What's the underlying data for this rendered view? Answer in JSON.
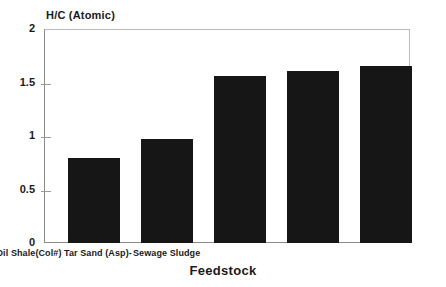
{
  "chart_data": {
    "type": "bar",
    "title": "",
    "subtitle": "",
    "xlabel": "Feedstock",
    "ylabel": "H/C (Atomic)",
    "categories": [
      "Bit Coal (Pitt#8)",
      "Sub-bit (Wy)",
      "Oil Shale(Col#)",
      "Tar Sand (Asp)-",
      "Sewage Sludge"
    ],
    "values": [
      0.79,
      0.97,
      1.56,
      1.61,
      1.65
    ],
    "ylim": [
      0,
      2
    ],
    "yticks": [
      "0",
      "0.5",
      "1",
      "1.5",
      "2"
    ],
    "ytick_values": [
      0,
      0.5,
      1,
      1.5,
      2
    ],
    "grid": false,
    "legend": null,
    "bar_color": "#161616",
    "axis_color": "#8a8a8a",
    "text_color": "#1a1a1a",
    "background": "#ffffff"
  }
}
